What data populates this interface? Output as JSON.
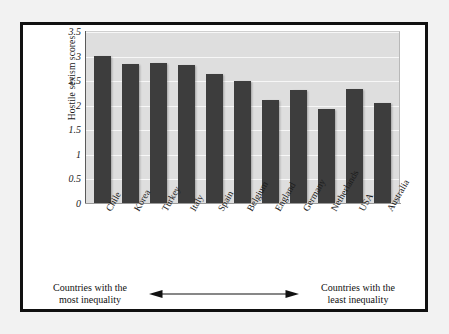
{
  "chart_data": {
    "type": "bar",
    "title": "",
    "xlabel": "",
    "ylabel": "Hostile sexism scores",
    "ylim": [
      0,
      3.5
    ],
    "yticks": [
      "0",
      "0.5",
      "1",
      "1.5",
      "2",
      "2.5",
      "3",
      "3.5"
    ],
    "ytick_values": [
      0,
      0.5,
      1,
      1.5,
      2,
      2.5,
      3,
      3.5
    ],
    "grid": true,
    "legend": "none",
    "bar_color": "#3d3d3d",
    "plot_background": "#dedede",
    "gridline_color": "#f7f7f7",
    "categories": [
      "Chile",
      "Korea",
      "Turkey",
      "Italy",
      "Spain",
      "Belgium",
      "England",
      "Germany",
      "Netherlands",
      "USA",
      "Australia"
    ],
    "values": [
      3.0,
      2.82,
      2.84,
      2.8,
      2.62,
      2.48,
      2.1,
      2.3,
      1.92,
      2.32,
      2.04
    ]
  },
  "caption": {
    "left_line1": "Countries with the",
    "left_line2": "most inequality",
    "right_line1": "Countries with the",
    "right_line2": "least inequality"
  }
}
